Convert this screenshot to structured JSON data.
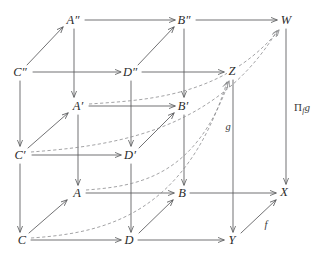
{
  "diagram": {
    "canvas": {
      "width": 325,
      "height": 261
    },
    "colors": {
      "background": "#ffffff",
      "solid_edge": "#58595b",
      "dashed_edge": "#8b8c8e",
      "label_text": "#2b2b2b"
    },
    "nodes": [
      {
        "id": "App",
        "label": "A″",
        "x": 73,
        "y": 20
      },
      {
        "id": "Bpp",
        "label": "B″",
        "x": 184,
        "y": 20
      },
      {
        "id": "W",
        "label": "W",
        "x": 286,
        "y": 20
      },
      {
        "id": "Cpp",
        "label": "C″",
        "x": 20,
        "y": 72
      },
      {
        "id": "Dpp",
        "label": "D″",
        "x": 130,
        "y": 72
      },
      {
        "id": "Z",
        "label": "Z",
        "x": 232,
        "y": 71
      },
      {
        "id": "Ap",
        "label": "A′",
        "x": 78,
        "y": 106
      },
      {
        "id": "Bp",
        "label": "B′",
        "x": 183,
        "y": 106
      },
      {
        "id": "Cp",
        "label": "C′",
        "x": 20,
        "y": 155
      },
      {
        "id": "Dp",
        "label": "D′",
        "x": 130,
        "y": 155
      },
      {
        "id": "A",
        "label": "A",
        "x": 77,
        "y": 193
      },
      {
        "id": "B",
        "label": "B",
        "x": 182,
        "y": 193
      },
      {
        "id": "X",
        "label": "X",
        "x": 284,
        "y": 192
      },
      {
        "id": "C",
        "label": "C",
        "x": 22,
        "y": 240
      },
      {
        "id": "D",
        "label": "D",
        "x": 129,
        "y": 240
      },
      {
        "id": "Y",
        "label": "Y",
        "x": 232,
        "y": 240
      }
    ],
    "map_labels": [
      {
        "id": "pi-f-g",
        "text": "Π",
        "sub": "f",
        "trail": "g",
        "x": 302,
        "y": 108,
        "style": "upright"
      },
      {
        "id": "g",
        "text": "g",
        "x": 228,
        "y": 127,
        "style": "italic"
      },
      {
        "id": "f",
        "text": "f",
        "x": 266,
        "y": 225,
        "style": "italic"
      }
    ],
    "edges": [
      {
        "from": "Apt",
        "to": "Bpp",
        "kind": "solid",
        "direction": "horizontal"
      },
      {
        "from": "Bpp",
        "to": "W",
        "kind": "solid",
        "direction": "horizontal"
      },
      {
        "from": "Cpp",
        "to": "Dpp",
        "kind": "solid",
        "direction": "horizontal"
      },
      {
        "from": "Dpp",
        "to": "Z",
        "kind": "solid",
        "direction": "horizontal"
      },
      {
        "from": "Ap",
        "to": "Bp",
        "kind": "solid",
        "direction": "horizontal"
      },
      {
        "from": "Cp",
        "to": "Dp",
        "kind": "solid",
        "direction": "horizontal"
      },
      {
        "from": "A",
        "to": "B",
        "kind": "solid",
        "direction": "horizontal"
      },
      {
        "from": "B",
        "to": "X",
        "kind": "solid",
        "direction": "horizontal"
      },
      {
        "from": "C",
        "to": "D",
        "kind": "solid",
        "direction": "horizontal"
      },
      {
        "from": "D",
        "to": "Y",
        "kind": "solid",
        "direction": "horizontal"
      },
      {
        "from": "Cpp",
        "to": "Apt",
        "kind": "solid",
        "direction": "diagonal"
      },
      {
        "from": "Dpp",
        "to": "Bpp",
        "kind": "solid",
        "direction": "diagonal"
      },
      {
        "from": "Cp",
        "to": "Ap",
        "kind": "solid",
        "direction": "diagonal"
      },
      {
        "from": "Dp",
        "to": "Bp",
        "kind": "solid",
        "direction": "diagonal"
      },
      {
        "from": "C",
        "to": "A",
        "kind": "solid",
        "direction": "diagonal"
      },
      {
        "from": "D",
        "to": "B",
        "kind": "solid",
        "direction": "diagonal"
      },
      {
        "from": "Y",
        "to": "X",
        "kind": "solid",
        "direction": "diagonal"
      },
      {
        "from": "Apt",
        "to": "Ap",
        "kind": "solid",
        "direction": "vertical"
      },
      {
        "from": "Ap",
        "to": "A",
        "kind": "solid",
        "direction": "vertical"
      },
      {
        "from": "Bpp",
        "to": "Bp",
        "kind": "solid",
        "direction": "vertical"
      },
      {
        "from": "Bp",
        "to": "B",
        "kind": "solid",
        "direction": "vertical"
      },
      {
        "from": "Cpp",
        "to": "Cp",
        "kind": "solid",
        "direction": "vertical"
      },
      {
        "from": "Cp",
        "to": "C",
        "kind": "solid",
        "direction": "vertical"
      },
      {
        "from": "Dpp",
        "to": "Dp",
        "kind": "solid",
        "direction": "vertical"
      },
      {
        "from": "Dp",
        "to": "D",
        "kind": "solid",
        "direction": "vertical"
      },
      {
        "from": "W",
        "to": "X",
        "kind": "solid",
        "direction": "vertical"
      },
      {
        "from": "Z",
        "to": "Y",
        "kind": "solid",
        "direction": "vertical"
      },
      {
        "from": "C",
        "to": "Z",
        "kind": "dashed",
        "direction": "curve"
      },
      {
        "from": "Cp",
        "to": "W",
        "kind": "dashed",
        "direction": "curve"
      },
      {
        "from": "A",
        "to": "Z",
        "kind": "dashed",
        "direction": "curve"
      },
      {
        "from": "Ap",
        "to": "W",
        "kind": "dashed",
        "direction": "curve"
      }
    ]
  }
}
